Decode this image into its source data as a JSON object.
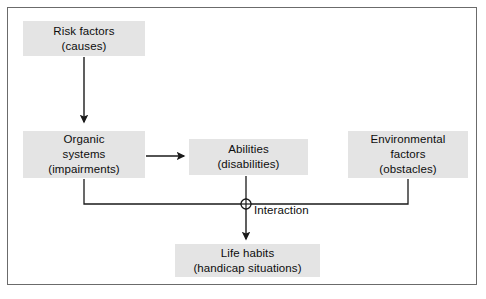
{
  "diagram": {
    "frame": {
      "border_color": "#6b6b6b",
      "background": "#ffffff"
    },
    "style": {
      "node_fill": "#e4e4e4",
      "text_color": "#0d0d0d",
      "connector_color": "#1a1a1a"
    },
    "nodes": [
      {
        "id": "risk-factors",
        "line1": "Risk factors",
        "line2": "(causes)",
        "line3": ""
      },
      {
        "id": "organic-systems",
        "line1": "Organic",
        "line2": "systems",
        "line3": "(impairments)"
      },
      {
        "id": "abilities",
        "line1": "Abilities",
        "line2": "(disabilities)",
        "line3": ""
      },
      {
        "id": "environmental-factors",
        "line1": "Environmental",
        "line2": "factors",
        "line3": "(obstacles)"
      },
      {
        "id": "life-habits",
        "line1": "Life habits",
        "line2": "(handicap situations)",
        "line3": ""
      }
    ],
    "junction": {
      "label": "Interaction",
      "symbol": "circled-plus"
    },
    "edges": [
      {
        "from": "risk-factors",
        "to": "organic-systems",
        "kind": "arrow-down"
      },
      {
        "from": "organic-systems",
        "to": "abilities",
        "kind": "arrow-right"
      },
      {
        "from": "organic-systems",
        "to": "interaction",
        "kind": "elbow"
      },
      {
        "from": "abilities",
        "to": "interaction",
        "kind": "line-down"
      },
      {
        "from": "environmental-factors",
        "to": "interaction",
        "kind": "elbow"
      },
      {
        "from": "interaction",
        "to": "life-habits",
        "kind": "arrow-down"
      }
    ]
  }
}
